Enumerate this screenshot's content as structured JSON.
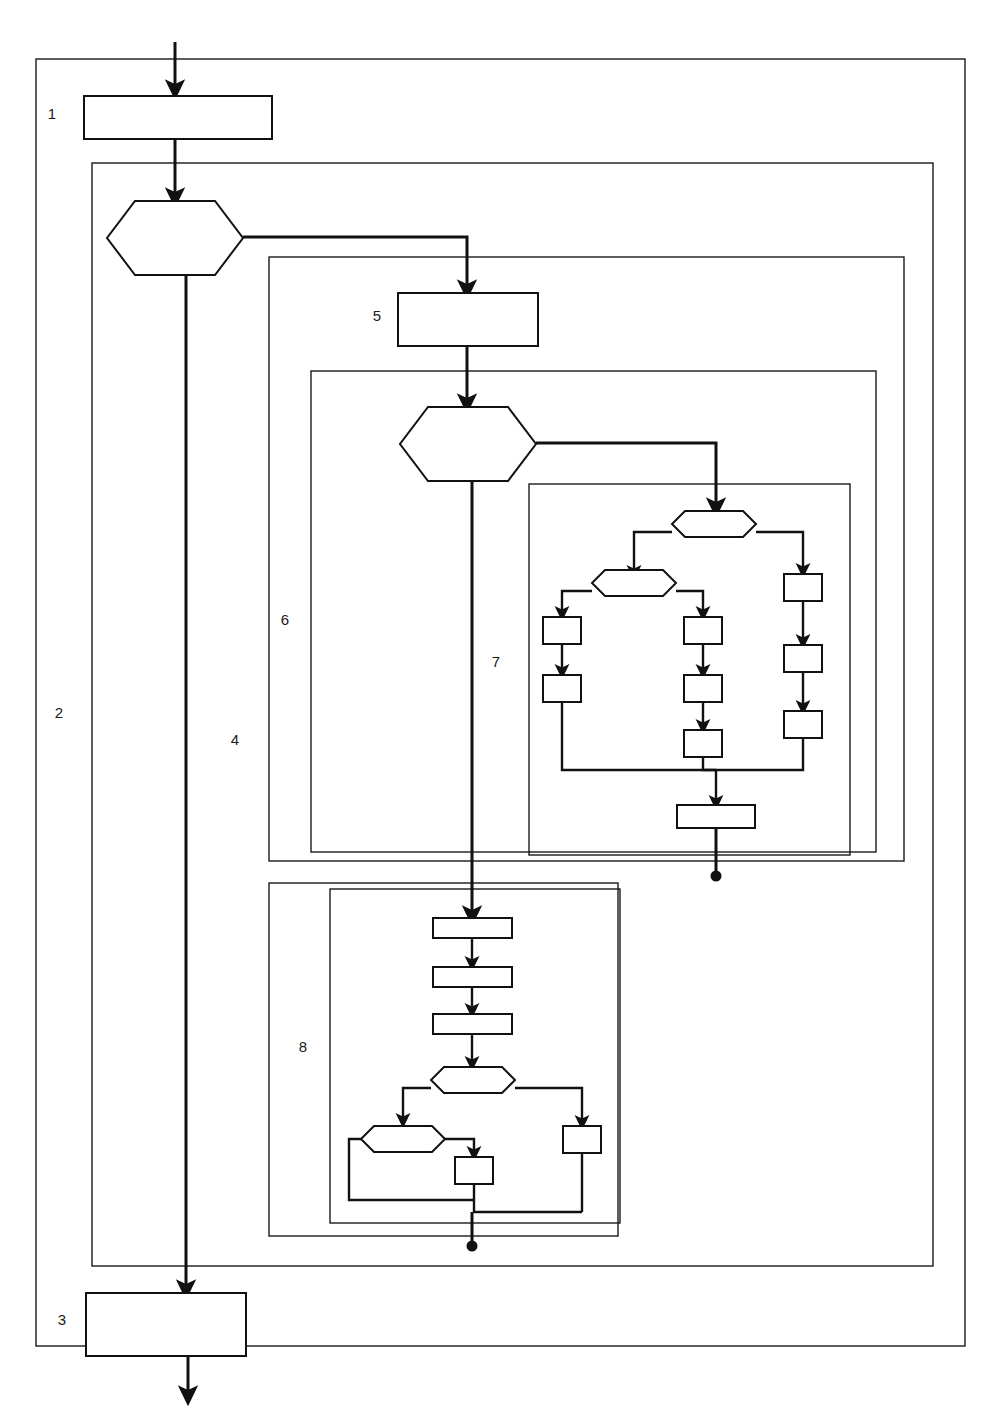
{
  "figure": {
    "title_fragment": "",
    "type": "flowchart",
    "background_color": "#ffffff",
    "line_color": "#111111",
    "frame_color": "#1a1a1a"
  },
  "regions": [
    {
      "id": "region-1",
      "number": "1",
      "label_x": 52,
      "label_y": 119
    },
    {
      "id": "region-2",
      "number": "2",
      "label_x": 59,
      "label_y": 718
    },
    {
      "id": "region-3",
      "number": "3",
      "label_x": 62,
      "label_y": 1325
    },
    {
      "id": "region-4",
      "number": "4",
      "label_x": 235,
      "label_y": 745
    },
    {
      "id": "region-5",
      "number": "5",
      "label_x": 377,
      "label_y": 321
    },
    {
      "id": "region-6",
      "number": "6",
      "label_x": 285,
      "label_y": 625
    },
    {
      "id": "region-7",
      "number": "7",
      "label_x": 496,
      "label_y": 667
    },
    {
      "id": "region-8",
      "number": "8",
      "label_x": 303,
      "label_y": 1052
    }
  ],
  "frames": [
    {
      "name": "outer-frame-2",
      "x": 36,
      "y": 59,
      "w": 929,
      "h": 1287
    },
    {
      "name": "frame-4",
      "x": 92,
      "y": 163,
      "w": 841,
      "h": 1103
    },
    {
      "name": "frame-6",
      "x": 269,
      "y": 257,
      "w": 635,
      "h": 604
    },
    {
      "name": "frame-7-outer",
      "x": 311,
      "y": 371,
      "w": 565,
      "h": 481
    },
    {
      "name": "frame-7-inner",
      "x": 529,
      "y": 484,
      "w": 321,
      "h": 371
    },
    {
      "name": "frame-8-outer",
      "x": 269,
      "y": 883,
      "w": 349,
      "h": 353
    },
    {
      "name": "frame-8-inner",
      "x": 330,
      "y": 889,
      "w": 290,
      "h": 334
    }
  ],
  "nodes": [
    {
      "name": "process-box-1",
      "shape": "rect",
      "x": 84,
      "y": 96,
      "w": 188,
      "h": 43
    },
    {
      "name": "decision-hex-1",
      "shape": "hex",
      "cx": 175,
      "cy": 238,
      "w": 136,
      "h": 74
    },
    {
      "name": "process-box-5",
      "shape": "rect",
      "x": 398,
      "y": 293,
      "w": 140,
      "h": 53
    },
    {
      "name": "decision-hex-2",
      "shape": "hex",
      "cx": 468,
      "cy": 444,
      "w": 136,
      "h": 74
    },
    {
      "name": "decision-hex-7a",
      "shape": "hex",
      "cx": 714,
      "cy": 524,
      "w": 84,
      "h": 26
    },
    {
      "name": "decision-hex-7b",
      "shape": "hex",
      "cx": 634,
      "cy": 583,
      "w": 84,
      "h": 26
    },
    {
      "name": "box-7-left-1",
      "shape": "rect",
      "x": 543,
      "y": 618,
      "w": 38,
      "h": 26
    },
    {
      "name": "box-7-left-2",
      "shape": "rect",
      "x": 543,
      "y": 676,
      "w": 38,
      "h": 26
    },
    {
      "name": "box-7-mid-1",
      "shape": "rect",
      "x": 684,
      "y": 618,
      "w": 38,
      "h": 26
    },
    {
      "name": "box-7-mid-2",
      "shape": "rect",
      "x": 684,
      "y": 676,
      "w": 38,
      "h": 26
    },
    {
      "name": "box-7-mid-3",
      "shape": "rect",
      "x": 684,
      "y": 731,
      "w": 38,
      "h": 26
    },
    {
      "name": "box-7-right-1",
      "shape": "rect",
      "x": 784,
      "y": 575,
      "w": 38,
      "h": 26
    },
    {
      "name": "box-7-right-2",
      "shape": "rect",
      "x": 784,
      "y": 646,
      "w": 38,
      "h": 26
    },
    {
      "name": "box-7-right-3",
      "shape": "rect",
      "x": 784,
      "y": 712,
      "w": 38,
      "h": 26
    },
    {
      "name": "box-7-merge",
      "shape": "rect",
      "x": 677,
      "y": 806,
      "w": 78,
      "h": 22
    },
    {
      "name": "box-8-step-1",
      "shape": "rect",
      "x": 433,
      "y": 919,
      "w": 79,
      "h": 19
    },
    {
      "name": "box-8-step-2",
      "shape": "rect",
      "x": 433,
      "y": 968,
      "w": 79,
      "h": 19
    },
    {
      "name": "box-8-step-3",
      "shape": "rect",
      "x": 433,
      "y": 1015,
      "w": 79,
      "h": 19
    },
    {
      "name": "decision-hex-8a",
      "shape": "hex",
      "cx": 473,
      "cy": 1080,
      "w": 84,
      "h": 26
    },
    {
      "name": "decision-hex-8b",
      "shape": "hex",
      "cx": 403,
      "cy": 1131,
      "w": 84,
      "h": 26
    },
    {
      "name": "box-8-inner",
      "shape": "rect",
      "x": 455,
      "y": 1158,
      "w": 38,
      "h": 26
    },
    {
      "name": "box-8-right",
      "shape": "rect",
      "x": 563,
      "y": 1127,
      "w": 38,
      "h": 26
    },
    {
      "name": "process-box-3",
      "shape": "rect",
      "x": 86,
      "y": 1293,
      "w": 160,
      "h": 63
    }
  ],
  "terminators": [
    {
      "name": "terminator-dot-region-7",
      "cx": 716,
      "cy": 876,
      "r": 5
    },
    {
      "name": "terminator-dot-region-8",
      "cx": 472,
      "cy": 1246,
      "r": 5
    }
  ],
  "entry_arrow": {
    "name": "entry-arrow",
    "x": 175,
    "y_start": 42,
    "y_end": 93
  },
  "exit_arrow": {
    "name": "exit-arrow",
    "x": 188,
    "y_start": 1356,
    "y_end": 1398
  }
}
